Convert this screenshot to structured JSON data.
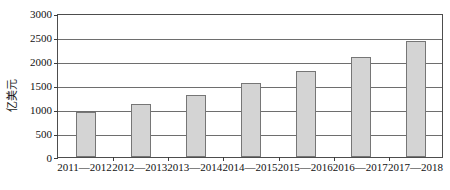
{
  "chart_data": {
    "type": "bar",
    "title": "",
    "subtitle": "",
    "xlabel": "",
    "ylabel": "亿美元",
    "categories": [
      "2011—2012",
      "2012—2013",
      "2013—2014",
      "2014—2015",
      "2015—2016",
      "2016—2017",
      "2017—2018"
    ],
    "values": [
      940,
      1100,
      1300,
      1540,
      1795,
      2085,
      2425
    ],
    "ylim": [
      0,
      3000
    ],
    "ytick_labels": [
      "0",
      "500",
      "1000",
      "1500",
      "2000",
      "2500",
      "3000"
    ],
    "ytick_values": [
      0,
      500,
      1000,
      1500,
      2000,
      2500,
      3000
    ],
    "grid": true,
    "legend": false,
    "legend_position": "none",
    "series": [
      {
        "name": "亿美元",
        "values": [
          940,
          1100,
          1300,
          1540,
          1795,
          2085,
          2425
        ]
      }
    ],
    "colors": {
      "bar_fill": "#d4d4d4",
      "bar_border": "#767676",
      "gridline": "#6e6e6e",
      "axis": "#4d4d4d",
      "text": "#121212",
      "background": "#ffffff"
    }
  }
}
